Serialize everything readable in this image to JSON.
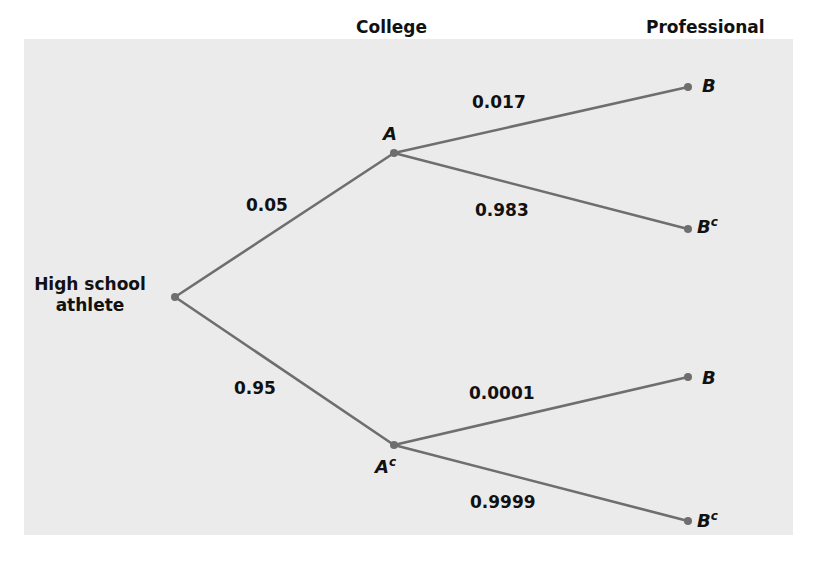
{
  "diagram": {
    "type": "probability-tree",
    "stages": {
      "college": "College",
      "professional": "Professional"
    },
    "root": {
      "line1": "High school",
      "line2": "athlete"
    },
    "colors": {
      "background": "#ebebeb",
      "branch": "#6e6e6e",
      "text": "#111111"
    },
    "level1": {
      "A": {
        "label": "A",
        "prob": "0.05"
      },
      "Ac": {
        "label": "A",
        "sup": "c",
        "prob": "0.95"
      }
    },
    "level2": {
      "A_B": {
        "label": "B",
        "prob": "0.017"
      },
      "A_Bc": {
        "label": "B",
        "sup": "c",
        "prob": "0.983"
      },
      "Ac_B": {
        "label": "B",
        "prob": "0.0001"
      },
      "Ac_Bc": {
        "label": "B",
        "sup": "c",
        "prob": "0.9999"
      }
    }
  }
}
